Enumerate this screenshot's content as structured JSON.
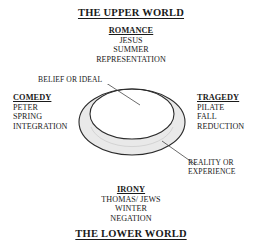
{
  "diagram": {
    "title_top": "THE UPPER WORLD",
    "title_bottom": "THE LOWER WORLD",
    "colors": {
      "ink": "#1a1a1a",
      "band_fill": "#e9e9e9",
      "outline": "#2b2b2b",
      "background": "#ffffff"
    },
    "quadrants": {
      "top": {
        "heading": "ROMANCE",
        "items": [
          "JESUS",
          "SUMMER",
          "REPRESENTATION"
        ]
      },
      "right": {
        "heading": "TRAGEDY",
        "items": [
          "PILATE",
          "FALL",
          "REDUCTION"
        ]
      },
      "bottom": {
        "heading": "IRONY",
        "items": [
          "THOMAS/ JEWS",
          "WINTER",
          "NEGATION"
        ]
      },
      "left": {
        "heading": "COMEDY",
        "items": [
          "PETER",
          "SPRING",
          "INTEGRATION"
        ]
      }
    },
    "annotations": {
      "upper_left": {
        "line1": "BELIEF OR IDEAL",
        "line2": ""
      },
      "lower_right": {
        "line1": "REALITY OR",
        "line2": "EXPERIENCE"
      }
    },
    "figure": {
      "name": "offset-ring",
      "outer_ellipse": {
        "cx": 54,
        "cy": 38,
        "rx": 53,
        "ry": 33
      },
      "inner_ellipse": {
        "cx": 54,
        "cy": 30,
        "rx": 42,
        "ry": 25
      }
    }
  }
}
